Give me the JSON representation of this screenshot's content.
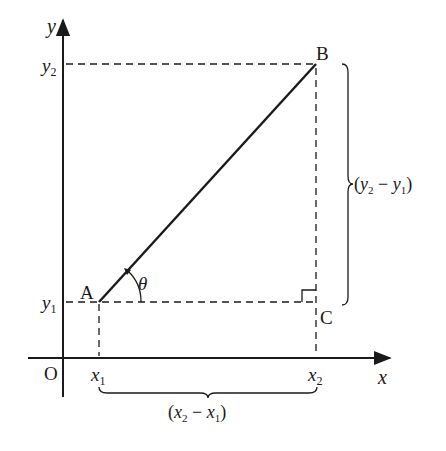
{
  "diagram": {
    "type": "coordinate-geometry-slope",
    "colors": {
      "ink": "#1a1a1a",
      "background": "#ffffff"
    },
    "axes": {
      "x_label": "x",
      "y_label": "y",
      "origin_label": "O"
    },
    "points": {
      "A": {
        "label": "A",
        "coords": "(x1, y1)"
      },
      "B": {
        "label": "B",
        "coords": "(x2, y2)"
      },
      "C": {
        "label": "C",
        "coords": "(x2, y1)"
      }
    },
    "ticks": {
      "x1": {
        "base": "x",
        "sub": "1"
      },
      "x2": {
        "base": "x",
        "sub": "2"
      },
      "y1": {
        "base": "y",
        "sub": "1"
      },
      "y2": {
        "base": "y",
        "sub": "2"
      }
    },
    "angle": {
      "label": "θ",
      "vertex": "A"
    },
    "right_angle_at": "C",
    "braces": {
      "vertical": {
        "open": "(",
        "a": "y",
        "a_sub": "2",
        "minus": " − ",
        "b": "y",
        "b_sub": "1",
        "close": ")"
      },
      "horizontal": {
        "open": "(",
        "a": "x",
        "a_sub": "2",
        "minus": " − ",
        "b": "x",
        "b_sub": "1",
        "close": ")"
      }
    }
  }
}
